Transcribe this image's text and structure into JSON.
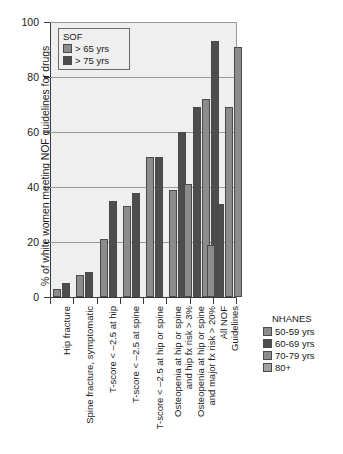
{
  "chart_data": {
    "type": "bar",
    "title": "",
    "xlabel": "",
    "ylabel": "% of white women meeting NOF guidelines for drugs",
    "ylim": [
      0,
      100
    ],
    "yticks": [
      0,
      20,
      40,
      60,
      80,
      100
    ],
    "grid": true,
    "categories": [
      "Hip fracture",
      "Spine fracture, symptomatic",
      "T-score < –2.5 at hip",
      "T-score < –2.5 at spine",
      "T-score < –2.5 at hip or spine",
      "Osteopenia at hip or spine and hip fx risk > 3%",
      "Osteopenia at hip or spine and major fx risk > 20%",
      "All NOF Guidelines"
    ],
    "category_lines": [
      [
        "Hip fracture"
      ],
      [
        "Spine fracture, symptomatic"
      ],
      [
        "T-score < –2.5 at hip"
      ],
      [
        "T-score < –2.5 at spine"
      ],
      [
        "T-score < –2.5 at hip or spine"
      ],
      [
        "Osteopenia at hip or spine",
        "and hip fx risk > 3%"
      ],
      [
        "Osteopenia at hip or spine",
        "and major fx risk > 20%"
      ],
      [
        "All NOF",
        "Guidelines"
      ]
    ],
    "series": [
      {
        "name": "> 65 yrs",
        "group": "SOF",
        "color": "#8c8c8c",
        "values": [
          3,
          8,
          21,
          33,
          51,
          39,
          41,
          null
        ]
      },
      {
        "name": "> 75 yrs",
        "group": "SOF",
        "color": "#4d4d4d",
        "values": [
          5,
          9,
          35,
          38,
          51,
          60,
          69,
          null
        ]
      },
      {
        "name": "50-59 yrs",
        "group": "NHANES",
        "color": "#8c8c8c",
        "values": [
          null,
          null,
          null,
          null,
          null,
          null,
          72,
          19
        ]
      },
      {
        "name": "60-69 yrs",
        "group": "NHANES",
        "color": "#4d4d4d",
        "values": [
          null,
          null,
          null,
          null,
          null,
          null,
          93,
          34
        ]
      },
      {
        "name": "70-79 yrs",
        "group": "NHANES",
        "color": "#8c8c8c",
        "values": [
          null,
          null,
          null,
          null,
          null,
          null,
          null,
          69
        ]
      },
      {
        "name": "80+",
        "group": "NHANES",
        "color": "#8c8c8c",
        "values": [
          null,
          null,
          null,
          null,
          null,
          null,
          null,
          91
        ]
      }
    ],
    "bars": [
      {
        "cat": 0,
        "series": "> 65 yrs",
        "value": 3,
        "color": "#8c8c8c"
      },
      {
        "cat": 0,
        "series": "> 75 yrs",
        "value": 5,
        "color": "#4d4d4d"
      },
      {
        "cat": 1,
        "series": "> 65 yrs",
        "value": 8,
        "color": "#8c8c8c"
      },
      {
        "cat": 1,
        "series": "> 75 yrs",
        "value": 9,
        "color": "#4d4d4d"
      },
      {
        "cat": 2,
        "series": "> 65 yrs",
        "value": 21,
        "color": "#8c8c8c"
      },
      {
        "cat": 2,
        "series": "> 75 yrs",
        "value": 35,
        "color": "#4d4d4d"
      },
      {
        "cat": 3,
        "series": "> 65 yrs",
        "value": 33,
        "color": "#8c8c8c"
      },
      {
        "cat": 3,
        "series": "> 75 yrs",
        "value": 38,
        "color": "#4d4d4d"
      },
      {
        "cat": 4,
        "series": "> 65 yrs",
        "value": 51,
        "color": "#8c8c8c"
      },
      {
        "cat": 4,
        "series": "> 75 yrs",
        "value": 51,
        "color": "#4d4d4d"
      },
      {
        "cat": 5,
        "series": "> 65 yrs",
        "value": 39,
        "color": "#8c8c8c"
      },
      {
        "cat": 5,
        "series": "> 75 yrs",
        "value": 60,
        "color": "#4d4d4d"
      },
      {
        "cat": 6,
        "series": "> 65 yrs",
        "value": 41,
        "color": "#8c8c8c"
      },
      {
        "cat": 6,
        "series": "> 75 yrs",
        "value": 69,
        "color": "#4d4d4d"
      },
      {
        "cat": 6,
        "series": "50-59 yrs",
        "value": 72,
        "color": "#8c8c8c"
      },
      {
        "cat": 6,
        "series": "60-69 yrs",
        "value": 93,
        "color": "#4d4d4d"
      },
      {
        "cat": 7,
        "series": "50-59 yrs",
        "value": 19,
        "color": "#8c8c8c"
      },
      {
        "cat": 7,
        "series": "60-69 yrs",
        "value": 34,
        "color": "#4d4d4d"
      },
      {
        "cat": 7,
        "series": "70-79 yrs",
        "value": 69,
        "color": "#8c8c8c"
      },
      {
        "cat": 7,
        "series": "80+",
        "value": 91,
        "color": "#8c8c8c"
      }
    ],
    "legends": [
      {
        "title": "SOF",
        "position": "inside-top-left",
        "entries": [
          {
            "label": "> 65 yrs",
            "color": "#8c8c8c"
          },
          {
            "label": "> 75 yrs",
            "color": "#4d4d4d"
          }
        ]
      },
      {
        "title": "NHANES",
        "position": "bottom-right",
        "entries": [
          {
            "label": "50-59 yrs",
            "color": "#8c8c8c"
          },
          {
            "label": "60-69 yrs",
            "color": "#4d4d4d"
          },
          {
            "label": "70-79 yrs",
            "color": "#8c8c8c"
          },
          {
            "label": "80+",
            "color": "#a0a0a0"
          }
        ]
      }
    ],
    "colors": {
      "plot_background": "#efefef",
      "page_background": "#ffffff",
      "axis": "#3a3a3a",
      "gridline": "#9a9a9a",
      "light_gray_bar": "#8c8c8c",
      "dark_gray_bar": "#4d4d4d"
    }
  }
}
